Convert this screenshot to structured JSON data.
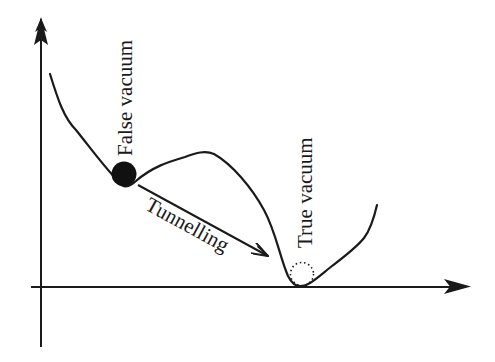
{
  "diagram": {
    "labels": {
      "false_vacuum": "False vacuum",
      "true_vacuum": "True vacuum",
      "tunnelling": "Tunnelling"
    },
    "axes": {
      "x_axis": {
        "from": [
          31,
          287
        ],
        "to": [
          470,
          287
        ],
        "arrow": true
      },
      "y_axis": {
        "from": [
          41,
          347
        ],
        "to": [
          41,
          17
        ],
        "arrow": true
      }
    },
    "potential_curve": {
      "description": "Potential with a local minimum (false vacuum) and a global minimum (true vacuum)",
      "start": [
        50,
        74
      ],
      "false_vacuum_min": [
        124,
        185
      ],
      "barrier_peak": [
        205,
        153
      ],
      "true_vacuum_min": [
        300,
        286
      ],
      "end": [
        377,
        205
      ]
    },
    "markers": {
      "false_vacuum_ball": {
        "cx": 124,
        "cy": 174,
        "r": 12,
        "style": "filled"
      },
      "true_vacuum_ball": {
        "cx": 302,
        "cy": 274,
        "r": 12,
        "style": "dotted"
      }
    },
    "tunnelling_arrow": {
      "from": [
        138,
        185
      ],
      "to": [
        268,
        256
      ]
    },
    "colors": {
      "stroke": "#1a1a1a",
      "background": "#ffffff"
    }
  }
}
